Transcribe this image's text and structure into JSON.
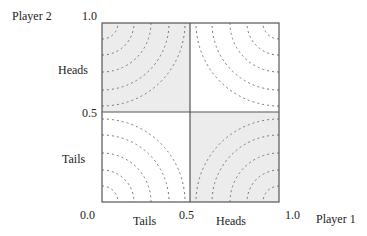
{
  "axes": {
    "y_title": "Player 2",
    "x_title": "Player 1",
    "y_ticks": {
      "top": "1.0",
      "mid": "0.5"
    },
    "x_ticks": {
      "origin": "0.0",
      "mid": "0.5",
      "right": "1.0"
    },
    "y_categories": {
      "upper": "Heads",
      "lower": "Tails"
    },
    "x_categories": {
      "left": "Tails",
      "right": "Heads"
    }
  },
  "regions": [
    {
      "name": "top-left",
      "shaded": true,
      "contour_corner": "top-left"
    },
    {
      "name": "top-right",
      "shaded": false,
      "contour_corner": "top-right"
    },
    {
      "name": "bottom-left",
      "shaded": false,
      "contour_corner": "bottom-left"
    },
    {
      "name": "bottom-right",
      "shaded": true,
      "contour_corner": "bottom-right"
    }
  ],
  "colors": {
    "shade": "#ececec",
    "line": "#555555",
    "contour": "#777777"
  }
}
